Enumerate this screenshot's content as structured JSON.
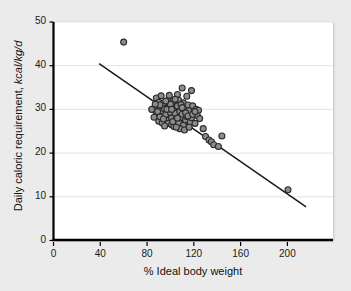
{
  "chart_data": {
    "type": "scatter",
    "title": "",
    "xlabel": "% Ideal body weight",
    "ylabel_main": "Daily caloric requirement,",
    "ylabel_units": "kcal/kg/d",
    "xlim": [
      0,
      239
    ],
    "ylim": [
      0,
      50
    ],
    "xticks": [
      0,
      40,
      80,
      120,
      160,
      200
    ],
    "xtick_labels": [
      "0",
      "40",
      "80",
      "120",
      "160",
      "200"
    ],
    "yticks": [
      0,
      10,
      20,
      30,
      40,
      50
    ],
    "ytick_labels": [
      "0",
      "10",
      "20",
      "30",
      "40",
      "50"
    ],
    "grid": "horizontal",
    "grid_color": "#e2e2e2",
    "legend": "none",
    "marker": {
      "shape": "circle",
      "fill": "#8c8c8c",
      "edge": "#2b2b2b",
      "size_px": 6
    },
    "trendline": {
      "type": "linear-fit",
      "color": "#1a1a1a",
      "x_start": 39,
      "y_start": 40.5,
      "x_end": 216,
      "y_end": 7.7
    },
    "points": [
      [
        60,
        45.4
      ],
      [
        88,
        32.6
      ],
      [
        90,
        31.6
      ],
      [
        86,
        30.2
      ],
      [
        84,
        30.0
      ],
      [
        88,
        29.0
      ],
      [
        86,
        28.2
      ],
      [
        90,
        27.3
      ],
      [
        92,
        30.9
      ],
      [
        93,
        29.6
      ],
      [
        91,
        28.3
      ],
      [
        94,
        31.4
      ],
      [
        95,
        30.1
      ],
      [
        96,
        28.8
      ],
      [
        97,
        27.5
      ],
      [
        93,
        26.9
      ],
      [
        98,
        32.0
      ],
      [
        99,
        30.6
      ],
      [
        100,
        29.3
      ],
      [
        101,
        28.0
      ],
      [
        98,
        26.8
      ],
      [
        102,
        31.8
      ],
      [
        103,
        30.4
      ],
      [
        104,
        29.1
      ],
      [
        105,
        27.8
      ],
      [
        101,
        26.5
      ],
      [
        106,
        33.4
      ],
      [
        107,
        32.1
      ],
      [
        106,
        30.8
      ],
      [
        108,
        29.5
      ],
      [
        109,
        28.2
      ],
      [
        107,
        26.9
      ],
      [
        110,
        34.9
      ],
      [
        111,
        31.5
      ],
      [
        112,
        30.2
      ],
      [
        110,
        28.9
      ],
      [
        113,
        27.6
      ],
      [
        111,
        26.3
      ],
      [
        114,
        33.0
      ],
      [
        115,
        31.0
      ],
      [
        116,
        29.7
      ],
      [
        114,
        28.4
      ],
      [
        117,
        27.1
      ],
      [
        118,
        34.3
      ],
      [
        119,
        30.8
      ],
      [
        120,
        29.4
      ],
      [
        118,
        28.1
      ],
      [
        121,
        26.8
      ],
      [
        122,
        30.0
      ],
      [
        123,
        28.6
      ],
      [
        124,
        29.8
      ],
      [
        125,
        27.9
      ],
      [
        92,
        33.1
      ],
      [
        95,
        26.2
      ],
      [
        99,
        33.2
      ],
      [
        103,
        26.1
      ],
      [
        108,
        25.6
      ],
      [
        112,
        25.3
      ],
      [
        116,
        25.9
      ],
      [
        89,
        29.5
      ],
      [
        91,
        31.0
      ],
      [
        97,
        30.0
      ],
      [
        100,
        31.2
      ],
      [
        104,
        32.3
      ],
      [
        109,
        31.1
      ],
      [
        113,
        29.2
      ],
      [
        105,
        25.9
      ],
      [
        87,
        31.2
      ],
      [
        94,
        27.8
      ],
      [
        102,
        27.2
      ],
      [
        106,
        28.0
      ],
      [
        110,
        30.4
      ],
      [
        115,
        28.5
      ],
      [
        96,
        31.9
      ],
      [
        101,
        30.0
      ],
      [
        119,
        28.9
      ],
      [
        121,
        29.5
      ],
      [
        128,
        25.6
      ],
      [
        130,
        23.8
      ],
      [
        133,
        23.0
      ],
      [
        135,
        22.6
      ],
      [
        137,
        21.9
      ],
      [
        141,
        21.5
      ],
      [
        144,
        23.9
      ],
      [
        200.5,
        11.6
      ]
    ]
  },
  "axis": {
    "spine_color": "#000000",
    "panel_background": "#ffffff",
    "figure_background": "#ebebeb"
  }
}
